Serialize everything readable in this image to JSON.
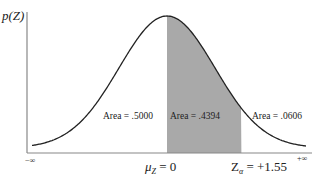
{
  "diagram": {
    "y_axis_label": "p(Z)",
    "x_left_label": "−∞",
    "x_right_label": "+∞",
    "mean_label": "μ",
    "mean_sub": "Z",
    "mean_value": " = 0",
    "z_label": "Z",
    "z_sub": "α",
    "z_value": " = +1.55",
    "areas": [
      {
        "label": "Area = .5000"
      },
      {
        "label": "Area = .4394"
      },
      {
        "label": "Area = .0606"
      }
    ],
    "colors": {
      "shade": "#a9a9a9",
      "curve": "#222222",
      "axis": "#888888"
    }
  },
  "chart_data": {
    "type": "area",
    "ylabel": "p(Z)",
    "xlabel": "Z",
    "x_range": [
      "-inf",
      "+inf"
    ],
    "mean": 0,
    "critical_z": 1.55,
    "shaded_interval": [
      0,
      1.55
    ],
    "regions": [
      {
        "interval": [
          "-inf",
          0
        ],
        "area": 0.5
      },
      {
        "interval": [
          0,
          1.55
        ],
        "area": 0.4394
      },
      {
        "interval": [
          1.55,
          "+inf"
        ],
        "area": 0.0606
      }
    ]
  }
}
